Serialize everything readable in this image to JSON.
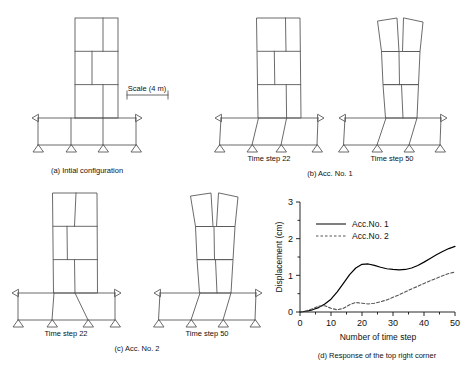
{
  "figure": {
    "panels": [
      {
        "id": "a",
        "caption": "(a) Intial configuration",
        "scale_label": "Scale (4 m)",
        "sublabels": []
      },
      {
        "id": "b",
        "caption": "(b) Acc. No. 1",
        "sublabels": [
          "Time step 22",
          "Time step 50"
        ]
      },
      {
        "id": "c",
        "caption": "(c) Acc. No. 2",
        "sublabels": [
          "Time step 22",
          "Time step 50"
        ]
      },
      {
        "id": "d",
        "caption": "(d) Response of the top right corner"
      }
    ]
  },
  "chart_data": {
    "type": "line",
    "title": "",
    "xlabel": "Number of time step",
    "ylabel": "Displacement (cm)",
    "xlim": [
      0,
      50
    ],
    "ylim": [
      0,
      3
    ],
    "xticks": [
      0,
      10,
      20,
      30,
      40,
      50
    ],
    "yticks": [
      0,
      1,
      2,
      3
    ],
    "x_minor_step": 5,
    "y_minor_step": 0.5,
    "grid": false,
    "legend_position": "upper-left-inside",
    "series": [
      {
        "name": "Acc.No. 1",
        "style": "solid",
        "color": "#000000",
        "x": [
          0,
          2,
          4,
          6,
          8,
          10,
          12,
          14,
          16,
          18,
          20,
          22,
          24,
          26,
          28,
          30,
          32,
          34,
          36,
          38,
          40,
          42,
          44,
          46,
          48,
          50
        ],
        "y": [
          0.0,
          0.02,
          0.06,
          0.12,
          0.22,
          0.35,
          0.55,
          0.78,
          1.02,
          1.2,
          1.3,
          1.31,
          1.27,
          1.22,
          1.18,
          1.16,
          1.15,
          1.16,
          1.2,
          1.27,
          1.36,
          1.46,
          1.56,
          1.65,
          1.73,
          1.79
        ]
      },
      {
        "name": "Acc.No. 2",
        "style": "dashed",
        "color": "#555555",
        "x": [
          0,
          2,
          4,
          6,
          8,
          10,
          12,
          14,
          16,
          18,
          20,
          22,
          24,
          26,
          28,
          30,
          32,
          34,
          36,
          38,
          40,
          42,
          44,
          46,
          48,
          50
        ],
        "y": [
          0.0,
          0.03,
          0.09,
          0.16,
          0.17,
          0.1,
          0.06,
          0.1,
          0.2,
          0.26,
          0.24,
          0.22,
          0.24,
          0.28,
          0.33,
          0.4,
          0.47,
          0.55,
          0.63,
          0.7,
          0.78,
          0.85,
          0.92,
          0.99,
          1.05,
          1.09
        ]
      }
    ]
  }
}
